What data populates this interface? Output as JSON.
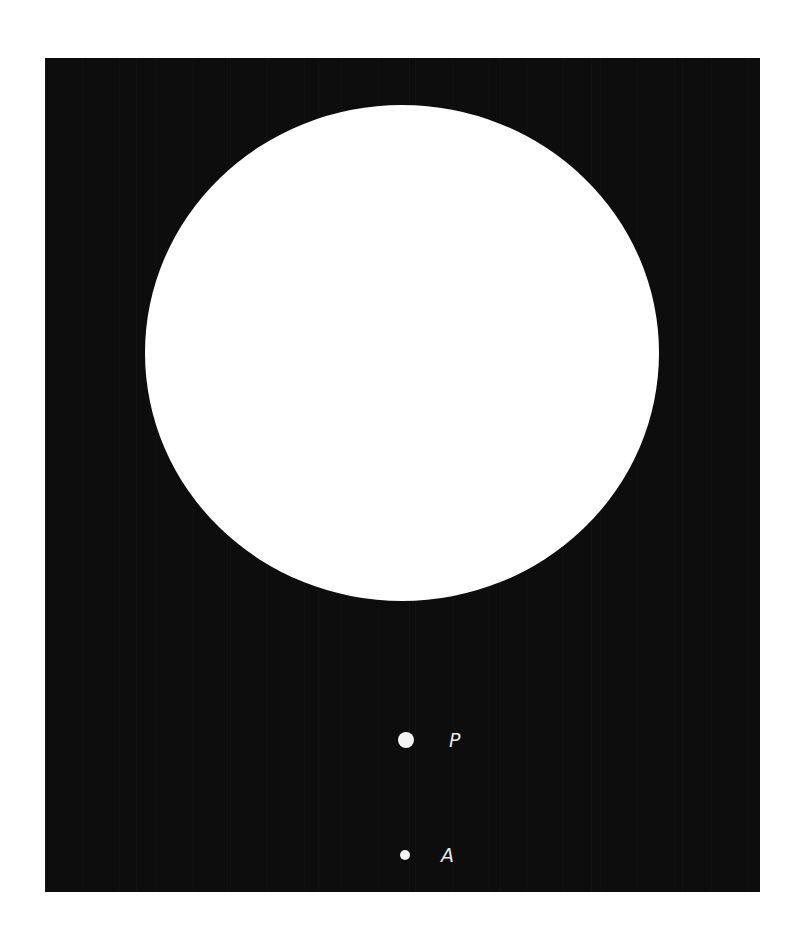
{
  "figure": {
    "background_color": "#0d0d0d",
    "disc_color": "#ffffff",
    "points": [
      {
        "id": "P",
        "label": "P"
      },
      {
        "id": "A",
        "label": "A"
      }
    ]
  }
}
